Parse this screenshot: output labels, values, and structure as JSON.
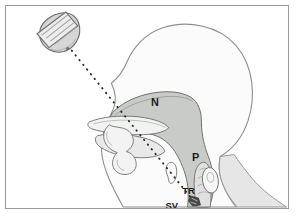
{
  "figure": {
    "type": "anatomical-illustration",
    "frame": {
      "border_color": "#9a9a9a",
      "background_color": "#ffffff"
    },
    "colors": {
      "head_fill": "#fbfbfb",
      "head_outline": "#8e8e8e",
      "airway_fill": "#c9cbc9",
      "airway_outline": "#6d6f6d",
      "neck_fill": "#e2e3e2",
      "probe_body": "#d9dad9",
      "probe_face": "#eceded",
      "probe_outline": "#6a6c6a",
      "beam_dot": "#2a2a2a",
      "label_text": "#1c1c1c",
      "sample_volume_marker": "#3a3a3a"
    },
    "labels": [
      {
        "id": "nasal-cavity",
        "text": "N",
        "x": 150,
        "y": 101
      },
      {
        "id": "pharynx",
        "text": "P",
        "x": 191,
        "y": 157
      },
      {
        "id": "trachea",
        "text": "TR",
        "x": 184,
        "y": 190
      },
      {
        "id": "sample-volume",
        "text": "SV",
        "x": 167,
        "y": 205
      }
    ],
    "probe": {
      "name": "ultrasound-transducer",
      "center_x": 52,
      "center_y": 33,
      "rotation_deg": -38,
      "stripe_count": 4
    },
    "beam": {
      "name": "ultrasound-beam-path",
      "style": "dotted",
      "dot_count": 34,
      "start": {
        "x": 66,
        "y": 45
      },
      "end": {
        "x": 190,
        "y": 198
      }
    },
    "structures": [
      {
        "id": "head-profile",
        "label": "head-profile"
      },
      {
        "id": "neck-shoulder",
        "label": "neck-and-shoulder"
      },
      {
        "id": "nasal-cavity",
        "label": "nasal-cavity"
      },
      {
        "id": "oral-cavity",
        "label": "oral-cavity"
      },
      {
        "id": "tongue",
        "label": "tongue"
      },
      {
        "id": "hard-palate",
        "label": "hard-palate"
      },
      {
        "id": "lips",
        "label": "lips"
      },
      {
        "id": "pharynx",
        "label": "pharynx"
      },
      {
        "id": "epiglottis",
        "label": "epiglottis"
      },
      {
        "id": "trachea",
        "label": "trachea"
      },
      {
        "id": "esophagus",
        "label": "esophagus"
      },
      {
        "id": "sample-volume",
        "label": "sample-volume-marker"
      }
    ]
  }
}
